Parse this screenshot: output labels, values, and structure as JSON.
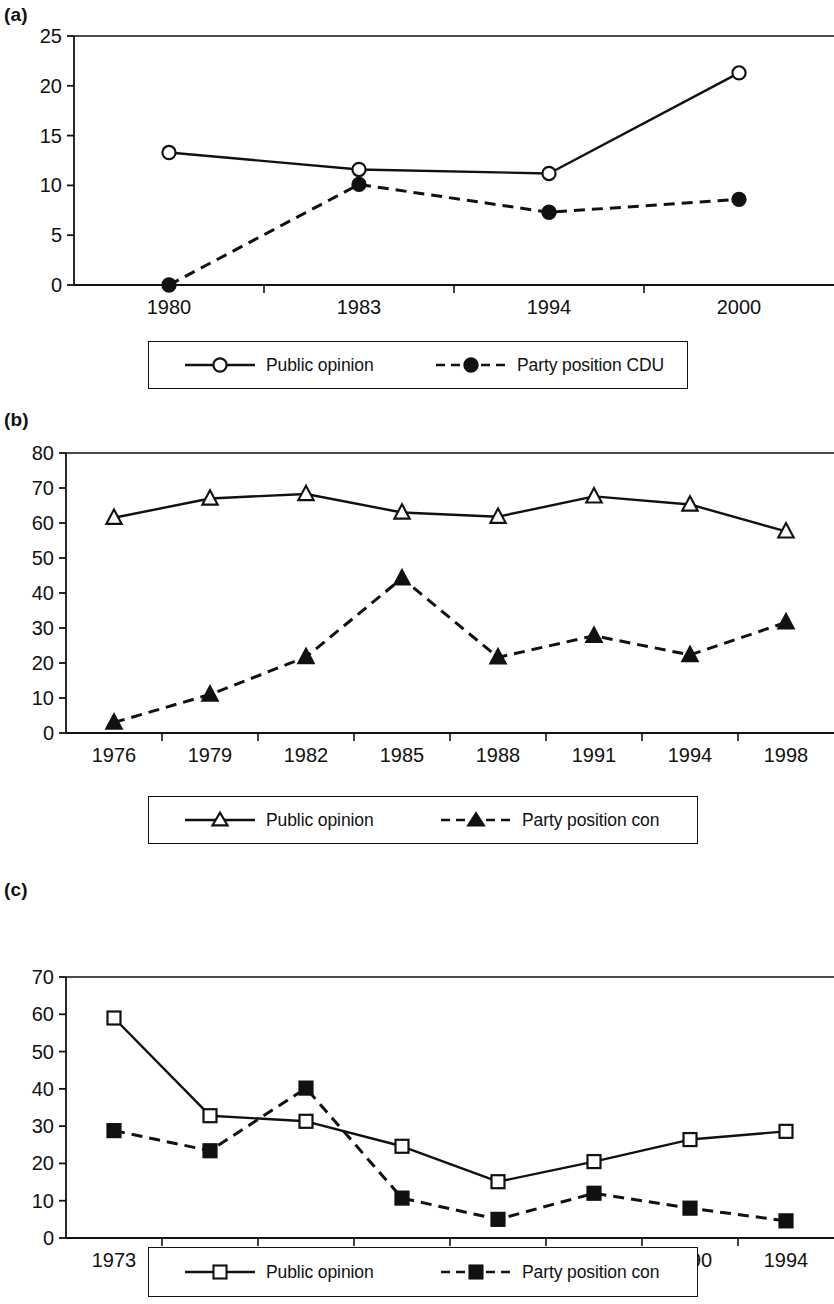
{
  "figure": {
    "panels": [
      {
        "id": "a",
        "label": "(a)"
      },
      {
        "id": "b",
        "label": "(b)"
      },
      {
        "id": "c",
        "label": "(c)"
      }
    ]
  },
  "chart_data": [
    {
      "panel": "a",
      "type": "line",
      "title": "",
      "xlabel": "",
      "ylabel": "",
      "grid": false,
      "legend_position": "bottom",
      "categories": [
        "1980",
        "1983",
        "1994",
        "2000"
      ],
      "ylim": [
        0,
        25
      ],
      "yticks": [
        0,
        5,
        10,
        15,
        20,
        25
      ],
      "yticklabels": [
        "0",
        "5",
        "10",
        "15",
        "20",
        "25"
      ],
      "series": [
        {
          "name": "Public opinion",
          "marker": "open-circle",
          "line": "solid",
          "values": [
            13.3,
            11.6,
            11.2,
            21.3
          ]
        },
        {
          "name": "Party position CDU",
          "marker": "filled-circle",
          "line": "dashed",
          "values": [
            0.0,
            10.1,
            7.3,
            8.6
          ]
        }
      ]
    },
    {
      "panel": "b",
      "type": "line",
      "title": "",
      "xlabel": "",
      "ylabel": "",
      "grid": false,
      "legend_position": "bottom",
      "categories": [
        "1976",
        "1979",
        "1982",
        "1985",
        "1988",
        "1991",
        "1994",
        "1998"
      ],
      "ylim": [
        0,
        80
      ],
      "yticks": [
        0,
        10,
        20,
        30,
        40,
        50,
        60,
        70,
        80
      ],
      "yticklabels": [
        "0",
        "10",
        "20",
        "30",
        "40",
        "50",
        "60",
        "70",
        "80"
      ],
      "series": [
        {
          "name": "Public opinion",
          "marker": "open-triangle",
          "line": "solid",
          "values": [
            61.5,
            67.0,
            68.3,
            63.0,
            61.8,
            67.6,
            65.3,
            57.6
          ]
        },
        {
          "name": "Party position con",
          "marker": "filled-triangle",
          "line": "dashed",
          "values": [
            3.0,
            11.0,
            21.7,
            44.2,
            21.6,
            27.8,
            22.3,
            31.6
          ]
        }
      ]
    },
    {
      "panel": "c",
      "type": "line",
      "title": "",
      "xlabel": "",
      "ylabel": "",
      "grid": false,
      "legend_position": "bottom",
      "categories": [
        "1973",
        "1979",
        "1981",
        "1984",
        "1987",
        "1988",
        "1990",
        "1994"
      ],
      "ylim": [
        0,
        70
      ],
      "yticks": [
        0,
        10,
        20,
        30,
        40,
        50,
        60,
        70
      ],
      "yticklabels": [
        "0",
        "10",
        "20",
        "30",
        "40",
        "50",
        "60",
        "70"
      ],
      "series": [
        {
          "name": "Public opinion",
          "marker": "open-square",
          "line": "solid",
          "values": [
            59.0,
            32.8,
            31.3,
            24.6,
            15.1,
            20.5,
            26.4,
            28.6
          ]
        },
        {
          "name": "Party position con",
          "marker": "filled-square",
          "line": "dashed",
          "values": [
            28.8,
            23.4,
            40.2,
            10.7,
            5.0,
            12.0,
            8.0,
            4.6
          ]
        }
      ]
    }
  ],
  "legends": {
    "a": {
      "left": {
        "label": "Public opinion",
        "marker": "open-circle",
        "line": "solid"
      },
      "right": {
        "label": "Party position CDU",
        "marker": "filled-circle",
        "line": "dashed"
      }
    },
    "b": {
      "left": {
        "label": "Public opinion",
        "marker": "open-triangle",
        "line": "solid"
      },
      "right": {
        "label": "Party position con",
        "marker": "filled-triangle",
        "line": "dashed"
      }
    },
    "c": {
      "left": {
        "label": "Public opinion",
        "marker": "open-square",
        "line": "solid"
      },
      "right": {
        "label": "Party position con",
        "marker": "filled-square",
        "line": "dashed"
      }
    }
  },
  "style": {
    "ink": "#111111",
    "paper": "#ffffff"
  }
}
